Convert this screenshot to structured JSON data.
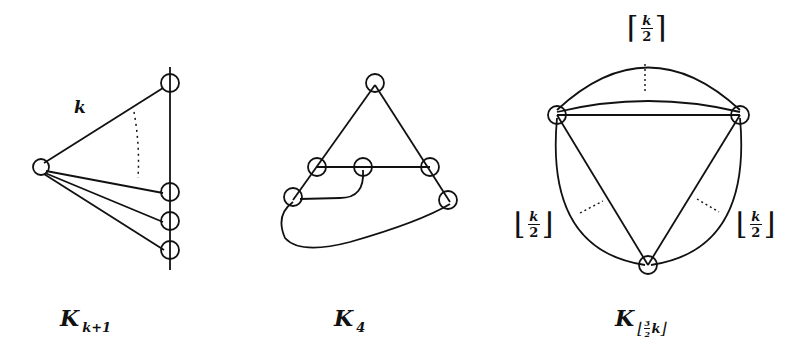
{
  "figures": [
    {
      "id": "complete-graph-k-plus-1",
      "caption": {
        "base": "K",
        "subscript": "k+1"
      },
      "edge_label": "k",
      "description": "Star: one vertex joined to k vertices on a vertical line",
      "center_vertex": [
        41,
        167
      ],
      "line_vertices": [
        [
          170,
          83
        ],
        [
          170,
          192
        ],
        [
          170,
          221
        ],
        [
          170,
          250
        ]
      ]
    },
    {
      "id": "complete-graph-4",
      "caption": {
        "base": "K",
        "subscript": "4"
      },
      "vertices": [
        [
          375,
          83
        ],
        [
          317,
          167
        ],
        [
          363,
          167
        ],
        [
          430,
          167
        ],
        [
          293,
          197
        ],
        [
          448,
          200
        ]
      ]
    },
    {
      "id": "complete-graph-three-halves-k",
      "caption": {
        "base": "K",
        "subscript_floor_num": "3",
        "subscript_floor_den": "2",
        "subscript_var": "k"
      },
      "top_label": {
        "bracket_open": "⌈",
        "num": "k",
        "den": "2",
        "bracket_close": "⌉"
      },
      "left_label": {
        "bracket_open": "⌊",
        "num": "k",
        "den": "2",
        "bracket_close": "⌋"
      },
      "right_label": {
        "bracket_open": "⌊",
        "num": "k",
        "den": "2",
        "bracket_close": "⌋"
      },
      "vertices": [
        [
          557,
          115
        ],
        [
          740,
          115
        ],
        [
          648,
          265
        ]
      ]
    }
  ],
  "colors": {
    "stroke": "#111111",
    "background": "#ffffff"
  }
}
